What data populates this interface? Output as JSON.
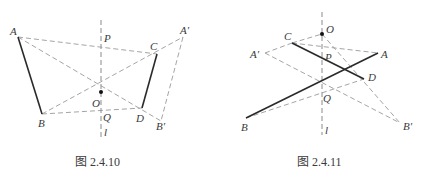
{
  "figures": [
    {
      "caption": "图 2.4.10",
      "labels": {
        "A": "A",
        "B": "B",
        "C": "C",
        "D": "D",
        "A_prime": "A′",
        "B_prime": "B′",
        "O": "O",
        "P": "P",
        "Q": "Q",
        "l": "l"
      },
      "points": {
        "A": [
          18,
          37
        ],
        "B": [
          42,
          114
        ],
        "C": [
          157,
          54
        ],
        "D": [
          142,
          108
        ],
        "A_prime": [
          183,
          37
        ],
        "B_prime": [
          161,
          121
        ],
        "O": [
          101,
          92
        ],
        "P": [
          101,
          46
        ],
        "Q": [
          101,
          111
        ]
      },
      "axis_l": {
        "x": 101,
        "y1": 20,
        "y2": 137
      },
      "solid_segments": [
        [
          "A",
          "B"
        ],
        [
          "C",
          "D"
        ]
      ],
      "dashed_segments": [
        [
          "A",
          "C"
        ],
        [
          "A",
          "B_prime"
        ],
        [
          "B",
          "A_prime"
        ],
        [
          "B",
          "D"
        ],
        [
          "A_prime",
          "B_prime"
        ]
      ]
    },
    {
      "caption": "图 2.4.11",
      "labels": {
        "A": "A",
        "B": "B",
        "C": "C",
        "D": "D",
        "A_prime": "A′",
        "B_prime": "B′",
        "O": "O",
        "P": "P",
        "Q": "Q",
        "l": "l"
      },
      "points": {
        "A": [
          378,
          53
        ],
        "B": [
          246,
          118
        ],
        "C": [
          292,
          43
        ],
        "D": [
          364,
          79
        ],
        "A_prime": [
          265,
          53
        ],
        "B_prime": [
          400,
          123
        ],
        "O": [
          322,
          34
        ],
        "P": [
          322,
          58
        ],
        "Q": [
          322,
          83
        ]
      },
      "axis_l": {
        "x": 322,
        "y1": 12,
        "y2": 135
      },
      "solid_segments": [
        [
          "A",
          "B"
        ],
        [
          "C",
          "D"
        ]
      ],
      "dashed_segments": [
        [
          "C",
          "A"
        ],
        [
          "C",
          "O"
        ],
        [
          "O",
          "B_prime"
        ],
        [
          "A_prime",
          "C"
        ],
        [
          "A_prime",
          "B_prime"
        ],
        [
          "B",
          "D"
        ]
      ]
    }
  ]
}
